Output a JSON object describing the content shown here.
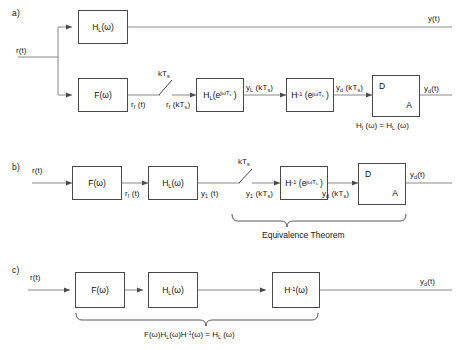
{
  "figure": {
    "stroke_color": "#4a4a4a",
    "wire_color": "#8a8a8a",
    "text_color": "#1a1a1a"
  },
  "panels": [
    {
      "id": "a",
      "label": "a)",
      "input_label": "r(t)",
      "outputs": [
        "y(t)",
        "yd(t)"
      ],
      "blocks": [
        {
          "name": "hl-omega",
          "text": "H_L(ω)"
        },
        {
          "name": "f-omega",
          "text": "F(ω)"
        },
        {
          "name": "hl-discrete",
          "text": "H_L(e^{jωTs})"
        },
        {
          "name": "h-inv-discrete",
          "text": "H^{-1}(e^{jωTs})"
        },
        {
          "name": "da-converter",
          "text": "D / A"
        }
      ],
      "sampler_label": "kTs",
      "signals": [
        "rf (t)",
        "rf (kTs)",
        "yL (kTs)",
        "yd (kTs)"
      ],
      "equation": "HI (ω) = HL (ω)"
    },
    {
      "id": "b",
      "label": "b)",
      "input_label": "r(t)",
      "outputs": [
        "yd(t)"
      ],
      "blocks": [
        {
          "name": "f-omega",
          "text": "F(ω)"
        },
        {
          "name": "hl-omega",
          "text": "H_L(ω)"
        },
        {
          "name": "h-inv-discrete",
          "text": "H^{-1}(e^{jωTs})"
        },
        {
          "name": "da-converter",
          "text": "D / A"
        }
      ],
      "sampler_label": "kTs",
      "signals": [
        "rf (t)",
        "y1 (t)",
        "y1 (kTs)",
        "yd (kTs)"
      ],
      "brace_caption": "Equivalence Theorem"
    },
    {
      "id": "c",
      "label": "c)",
      "input_label": "r(t)",
      "outputs": [
        "yd(t)"
      ],
      "blocks": [
        {
          "name": "f-omega",
          "text": "F(ω)"
        },
        {
          "name": "hl-omega",
          "text": "H_L(ω)"
        },
        {
          "name": "h-inv-omega",
          "text": "H^{-1}(ω)"
        }
      ],
      "brace_caption": "F(ω)HL(ω)H^{-1}(ω) = HL (ω)"
    }
  ],
  "labels": {
    "panel_a": "a)",
    "panel_b": "b)",
    "panel_c": "c)",
    "r_t": "r(t)",
    "y_t": "y(t)",
    "k_ts": "kT",
    "k_ts_sub": "s",
    "equivalence_theorem": "Equivalence Theorem"
  }
}
